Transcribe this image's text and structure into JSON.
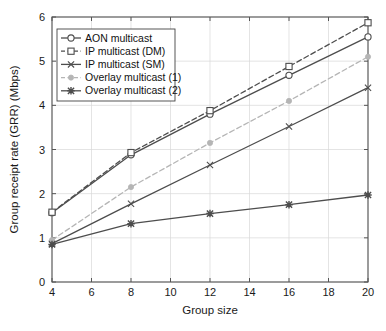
{
  "chart_data": {
    "type": "line",
    "title": "",
    "xlabel": "Group size",
    "ylabel": "Group receipt rate (GRR) (Mbps)",
    "x": [
      4,
      8,
      12,
      16,
      20
    ],
    "xlim": [
      4,
      20
    ],
    "ylim": [
      0,
      6
    ],
    "xticks": [
      "4",
      "6",
      "8",
      "10",
      "12",
      "14",
      "16",
      "18",
      "20"
    ],
    "xtick_values": [
      4,
      6,
      8,
      10,
      12,
      14,
      16,
      18,
      20
    ],
    "yticks": [
      "0",
      "1",
      "2",
      "3",
      "4",
      "5",
      "6"
    ],
    "ytick_values": [
      0,
      1,
      2,
      3,
      4,
      5,
      6
    ],
    "grid": true,
    "legend_position": "upper left",
    "series": [
      {
        "name": "AON multicast",
        "values": [
          1.57,
          2.88,
          3.8,
          4.68,
          5.55
        ],
        "color": "#4d4d4d",
        "line_style": "solid",
        "marker": "circle"
      },
      {
        "name": "IP multicast (DM)",
        "values": [
          1.58,
          2.93,
          3.88,
          4.88,
          5.87
        ],
        "color": "#4d4d4d",
        "line_style": "dashed",
        "marker": "square"
      },
      {
        "name": "IP multicast (SM)",
        "values": [
          0.87,
          1.77,
          2.65,
          3.52,
          4.4
        ],
        "color": "#4d4d4d",
        "line_style": "solid",
        "marker": "x"
      },
      {
        "name": "Overlay multicast (1)",
        "values": [
          0.95,
          2.15,
          3.15,
          4.1,
          5.1
        ],
        "color": "#b5b5b5",
        "line_style": "dashed",
        "marker": "dot"
      },
      {
        "name": "Overlay multicast (2)",
        "values": [
          0.85,
          1.32,
          1.55,
          1.75,
          1.97
        ],
        "color": "#4d4d4d",
        "line_style": "solid",
        "marker": "star"
      }
    ]
  }
}
